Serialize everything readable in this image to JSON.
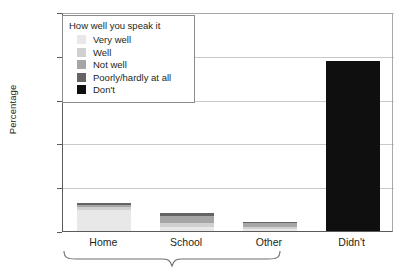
{
  "chart_data": {
    "type": "bar",
    "subtype": "stacked-bar",
    "title": "",
    "xlabel": "",
    "ylabel": "Percentage",
    "ylim": [
      0,
      100
    ],
    "ytick_labels": [
      "0%",
      "20%",
      "40%",
      "60%",
      "80%",
      "100%"
    ],
    "ytick_values": [
      0,
      20,
      40,
      60,
      80,
      100
    ],
    "grid": "horizontal",
    "categories": [
      "Home",
      "School",
      "Other",
      "Didn't"
    ],
    "legend": {
      "title": "How well you speak it",
      "position": "upper-left-inside",
      "entries": [
        {
          "label": "Very well",
          "color": "#e8e8e8"
        },
        {
          "label": "Well",
          "color": "#d0d0d0"
        },
        {
          "label": "Not well",
          "color": "#a6a6a6"
        },
        {
          "label": "Poorly/hardly at all",
          "color": "#646464"
        },
        {
          "label": "Don't",
          "color": "#100f0f"
        }
      ]
    },
    "series": [
      {
        "name": "Very well",
        "color": "#e8e8e8",
        "values": [
          9.5,
          2.0,
          1.0,
          0
        ]
      },
      {
        "name": "Well",
        "color": "#d0d0d0",
        "values": [
          1.4,
          1.6,
          0.9,
          0
        ]
      },
      {
        "name": "Not well",
        "color": "#a6a6a6",
        "values": [
          1.2,
          3.2,
          1.7,
          0
        ]
      },
      {
        "name": "Poorly/hardly at all",
        "color": "#646464",
        "values": [
          0.9,
          1.4,
          0.6,
          0
        ]
      },
      {
        "name": "Don't",
        "color": "#100f0f",
        "values": [
          0,
          0,
          0,
          77.6
        ]
      }
    ],
    "totals": [
      13.0,
      8.2,
      4.2,
      77.6
    ],
    "annotation": {
      "type": "curly-brace",
      "spans": [
        "Home",
        "School",
        "Other"
      ],
      "label": ""
    }
  }
}
